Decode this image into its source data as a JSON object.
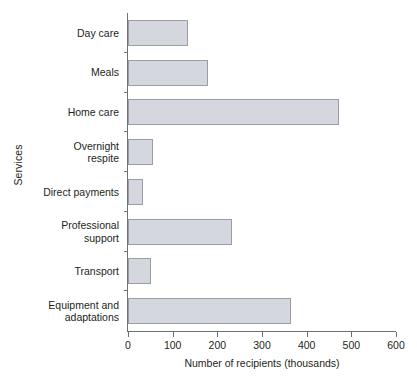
{
  "chart_data": {
    "type": "bar",
    "orientation": "horizontal",
    "title": "",
    "xlabel": "Number of recipients (thousands)",
    "ylabel": "Services",
    "categories": [
      "Day care",
      "Meals",
      "Home care",
      "Overnight\nrespite",
      "Direct payments",
      "Professional\nsupport",
      "Transport",
      "Equipment and\nadaptations"
    ],
    "values": [
      135,
      180,
      472,
      55,
      33,
      232,
      52,
      366
    ],
    "xlim": [
      0,
      600
    ],
    "xticks": [
      0,
      100,
      200,
      300,
      400,
      500,
      600
    ],
    "xtick_labels": [
      "0",
      "100",
      "200",
      "300",
      "400",
      "500",
      "600"
    ],
    "grid": false,
    "legend": false,
    "bar_fill": "#d4d7de",
    "bar_stroke": "#9a9da6",
    "axis_color": "#6f7071",
    "text_color": "#231f20"
  }
}
